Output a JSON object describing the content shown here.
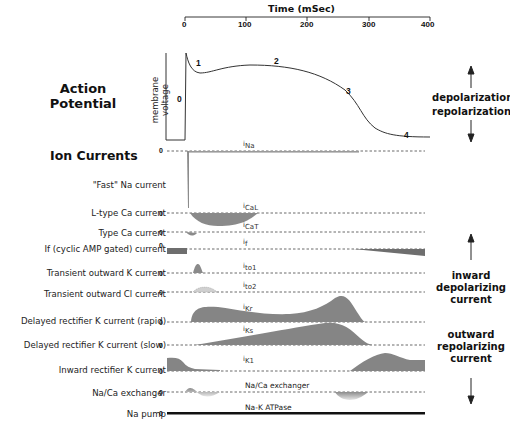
{
  "time_axis": {
    "title": "Time (mSec)",
    "ticks": [
      "0",
      "100",
      "200",
      "300",
      "400"
    ]
  },
  "action_potential": {
    "title_line1": "Action",
    "title_line2": "Potential",
    "y_label": "membrane voltage",
    "zero_label": "0",
    "phases": [
      "0",
      "1",
      "2",
      "3",
      "4"
    ],
    "depolarization_label": "depolarization",
    "repolarization_label": "repolarization"
  },
  "ion_currents": {
    "title": "Ion Currents",
    "rows": [
      {
        "label": "\"Fast\" Na current",
        "trace": "iNa",
        "sub": "Na",
        "zero": "0"
      },
      {
        "label": "L-type Ca current",
        "trace": "iCaL",
        "sub": "CaL",
        "zero": "0"
      },
      {
        "label": "Type Ca current",
        "trace": "iCaT",
        "sub": "CaT",
        "zero": "0"
      },
      {
        "label": "If (cyclic AMP gated) current",
        "trace": "if",
        "sub": "f",
        "zero": "0"
      },
      {
        "label": "Transient outward K current",
        "trace": "ito1",
        "sub": "to1",
        "zero": "0"
      },
      {
        "label": "Transient outward Cl current",
        "trace": "ito2",
        "sub": "to2",
        "zero": "0"
      },
      {
        "label": "Delayed rectifier K current (rapid)",
        "trace": "iKr",
        "sub": "Kr",
        "zero": "0"
      },
      {
        "label": "Delayed rectifier K current (slow)",
        "trace": "iKs",
        "sub": "Ks",
        "zero": "0"
      },
      {
        "label": "Inward rectifier K current",
        "trace": "iK1",
        "sub": "K1",
        "zero": "0"
      },
      {
        "label": "Na/Ca exchanger",
        "trace": "Na/Ca exchanger",
        "sub": "",
        "zero": "0"
      },
      {
        "label": "Na pump",
        "trace": "Na-K ATPase",
        "sub": "",
        "zero": "0"
      }
    ],
    "inward_label": [
      "inward",
      "depolarizing",
      "current"
    ],
    "outward_label": [
      "outward",
      "repolarizing",
      "current"
    ]
  },
  "colors": {
    "fill_dark": "#7a7a7a",
    "fill_mid": "#8c8c8c",
    "fill_light": "#c8c8c8",
    "line": "#333333",
    "background": "#ffffff"
  }
}
